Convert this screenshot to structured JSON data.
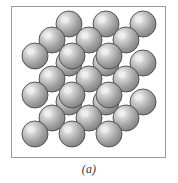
{
  "figure": {
    "caption": "(a)",
    "kind": "crystal-lattice-ball-and-stick",
    "frame": {
      "x": 11,
      "y": 6,
      "width": 155,
      "height": 152,
      "border_color": "#9a9a9a",
      "background_color": "#ffffff"
    }
  },
  "lattice": {
    "structure": "simple cubic",
    "grid": {
      "nx": 3,
      "ny": 3,
      "nz": 3
    },
    "atom_count": 27,
    "bond_count": 54,
    "projection": {
      "origin_x": 23,
      "origin_y": 127,
      "step_x": 37,
      "step_y": 39,
      "depth_dx": 17,
      "depth_dy": -16
    },
    "atom": {
      "radius": 13,
      "highlight_color": "#f0f0f0",
      "mid_color": "#bdbdbd",
      "shade_color": "#8f8f8f",
      "edge_color": "#6e6e6e",
      "outline_color": "#4a4a4a",
      "highlight_offset_x": -0.32,
      "highlight_offset_y": -0.34
    },
    "bond": {
      "thickness": 6,
      "color": "#3c3c3c",
      "edge_color": "#222222"
    }
  }
}
